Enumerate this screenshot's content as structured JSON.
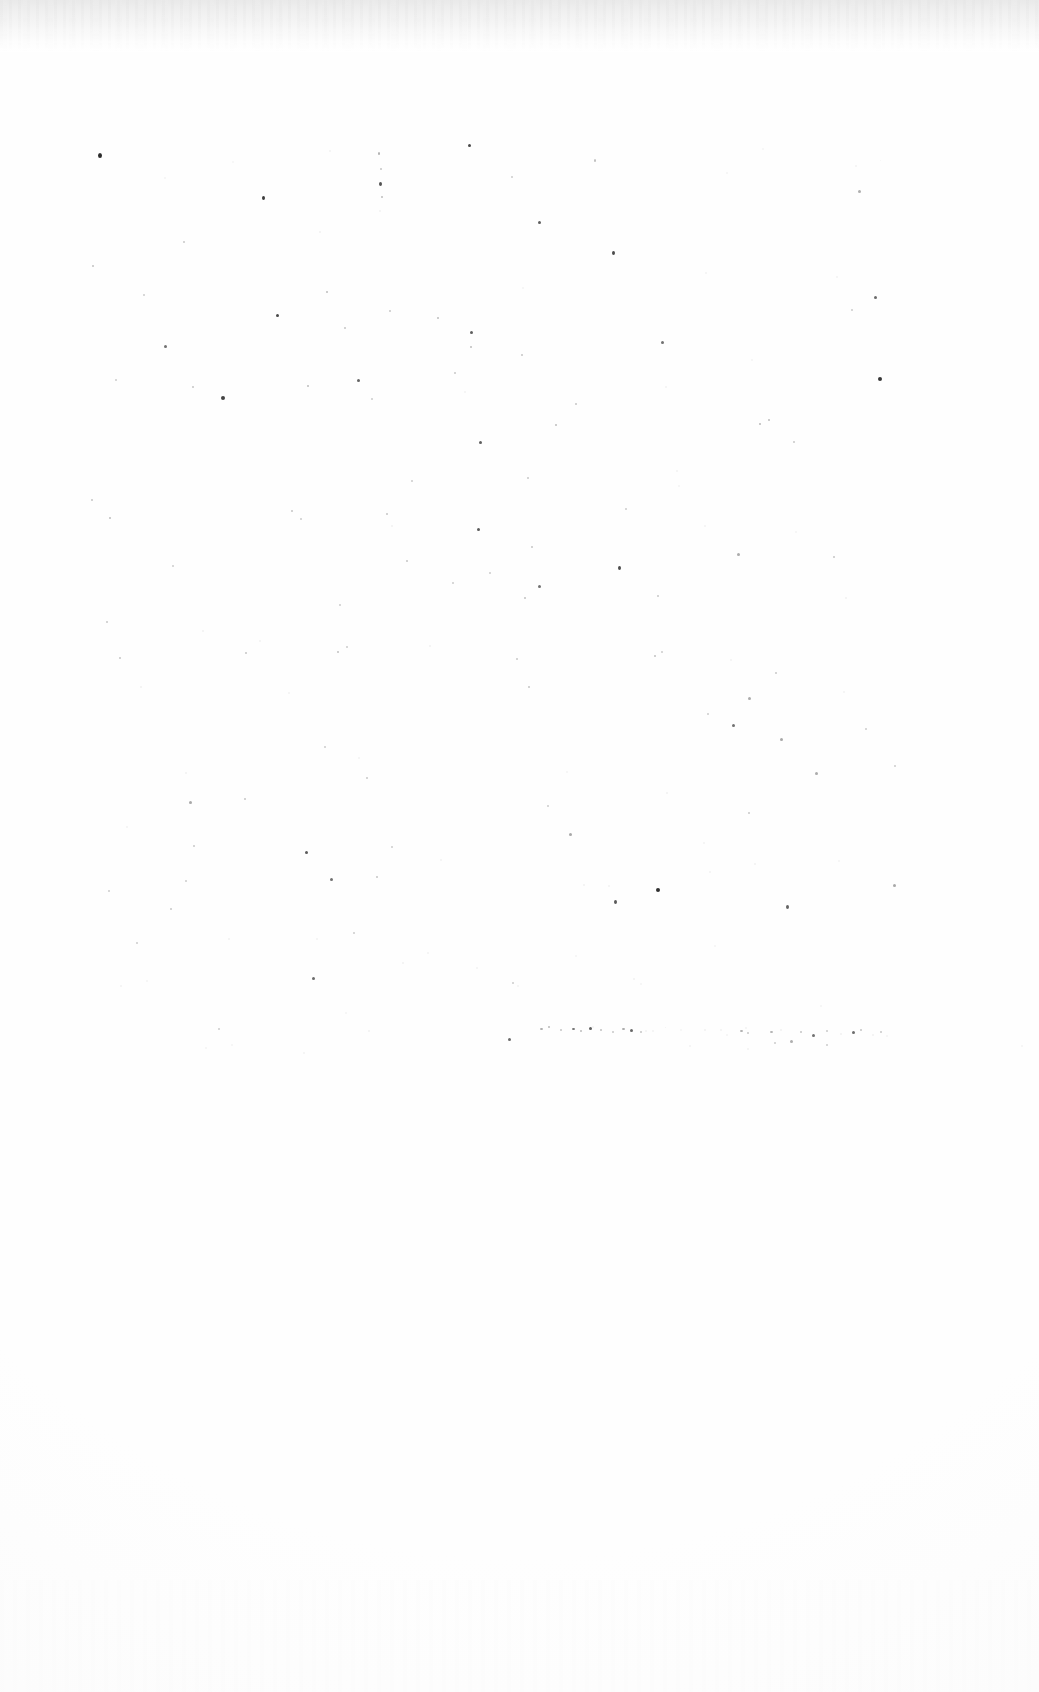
{
  "document": {
    "kind": "scanned-page",
    "page_state": "blank",
    "visible_text": "",
    "width": 1039,
    "height": 1692
  },
  "appearance": {
    "page_background": "#fefefe",
    "paper_white": "#ffffff",
    "edge_shadow_color": "#e9e9e9",
    "edge_shadow_height": 52,
    "speck_dark": "#1a1a1a",
    "speck_mid": "#6e6e6e",
    "speck_light": "#d8d8d8"
  },
  "regions": {
    "top_edge_band": {
      "y": 0,
      "height": 52,
      "description": "scanner edge shadow"
    },
    "speckled_body": {
      "y": 90,
      "height": 945,
      "description": "dust and noise specks"
    },
    "ghost_print_line": {
      "y": 1020,
      "x": 540,
      "width": 350,
      "description": "faded broken line of print residue"
    },
    "blank_lower": {
      "y": 1050,
      "height": 642,
      "description": "blank white area"
    }
  },
  "specks": [
    [
      98,
      153,
      4,
      5,
      0.92
    ],
    [
      232,
      161,
      2,
      2,
      0.22
    ],
    [
      329,
      150,
      2,
      2,
      0.3
    ],
    [
      378,
      152,
      2,
      3,
      0.55
    ],
    [
      380,
      168,
      2,
      2,
      0.4
    ],
    [
      379,
      182,
      3,
      4,
      0.75
    ],
    [
      381,
      196,
      2,
      2,
      0.45
    ],
    [
      379,
      210,
      2,
      2,
      0.3
    ],
    [
      468,
      144,
      3,
      3,
      0.8
    ],
    [
      511,
      176,
      2,
      2,
      0.35
    ],
    [
      594,
      159,
      2,
      3,
      0.45
    ],
    [
      726,
      172,
      2,
      2,
      0.25
    ],
    [
      762,
      148,
      2,
      2,
      0.22
    ],
    [
      855,
      165,
      2,
      2,
      0.3
    ],
    [
      858,
      190,
      3,
      3,
      0.55
    ],
    [
      880,
      160,
      1,
      1,
      0.18
    ],
    [
      164,
      177,
      2,
      2,
      0.28
    ],
    [
      262,
      196,
      3,
      4,
      0.85
    ],
    [
      319,
      231,
      2,
      2,
      0.32
    ],
    [
      183,
      241,
      2,
      2,
      0.38
    ],
    [
      92,
      265,
      2,
      2,
      0.42
    ],
    [
      143,
      294,
      2,
      2,
      0.35
    ],
    [
      276,
      314,
      3,
      3,
      0.8
    ],
    [
      344,
      327,
      2,
      2,
      0.4
    ],
    [
      164,
      345,
      3,
      3,
      0.62
    ],
    [
      326,
      291,
      2,
      2,
      0.45
    ],
    [
      389,
      310,
      2,
      2,
      0.38
    ],
    [
      437,
      317,
      2,
      2,
      0.45
    ],
    [
      470,
      331,
      3,
      3,
      0.7
    ],
    [
      522,
      287,
      2,
      2,
      0.28
    ],
    [
      538,
      221,
      3,
      3,
      0.7
    ],
    [
      612,
      251,
      3,
      4,
      0.78
    ],
    [
      705,
      272,
      2,
      2,
      0.3
    ],
    [
      836,
      276,
      2,
      2,
      0.3
    ],
    [
      874,
      296,
      3,
      3,
      0.65
    ],
    [
      851,
      309,
      2,
      2,
      0.35
    ],
    [
      661,
      341,
      3,
      3,
      0.62
    ],
    [
      470,
      346,
      2,
      2,
      0.45
    ],
    [
      521,
      354,
      2,
      2,
      0.4
    ],
    [
      751,
      359,
      2,
      2,
      0.28
    ],
    [
      115,
      379,
      2,
      2,
      0.35
    ],
    [
      192,
      386,
      2,
      2,
      0.4
    ],
    [
      221,
      396,
      4,
      4,
      0.82
    ],
    [
      307,
      385,
      2,
      2,
      0.45
    ],
    [
      357,
      379,
      3,
      3,
      0.68
    ],
    [
      371,
      398,
      2,
      2,
      0.35
    ],
    [
      454,
      372,
      2,
      2,
      0.38
    ],
    [
      464,
      391,
      2,
      2,
      0.3
    ],
    [
      575,
      403,
      2,
      2,
      0.4
    ],
    [
      665,
      386,
      2,
      2,
      0.3
    ],
    [
      878,
      377,
      4,
      4,
      0.88
    ],
    [
      759,
      423,
      2,
      2,
      0.48
    ],
    [
      768,
      419,
      2,
      2,
      0.45
    ],
    [
      793,
      441,
      2,
      2,
      0.38
    ],
    [
      555,
      424,
      2,
      2,
      0.45
    ],
    [
      479,
      441,
      3,
      3,
      0.7
    ],
    [
      411,
      480,
      2,
      2,
      0.35
    ],
    [
      527,
      477,
      2,
      2,
      0.38
    ],
    [
      676,
      470,
      2,
      2,
      0.3
    ],
    [
      678,
      485,
      2,
      2,
      0.28
    ],
    [
      91,
      499,
      2,
      2,
      0.4
    ],
    [
      109,
      517,
      2,
      2,
      0.45
    ],
    [
      291,
      510,
      2,
      2,
      0.4
    ],
    [
      300,
      518,
      2,
      2,
      0.35
    ],
    [
      386,
      513,
      2,
      2,
      0.4
    ],
    [
      391,
      525,
      2,
      2,
      0.32
    ],
    [
      477,
      528,
      3,
      3,
      0.72
    ],
    [
      531,
      546,
      2,
      2,
      0.4
    ],
    [
      625,
      508,
      2,
      2,
      0.35
    ],
    [
      704,
      525,
      2,
      2,
      0.3
    ],
    [
      795,
      531,
      2,
      2,
      0.28
    ],
    [
      833,
      556,
      2,
      2,
      0.4
    ],
    [
      737,
      553,
      3,
      3,
      0.58
    ],
    [
      172,
      565,
      2,
      2,
      0.35
    ],
    [
      406,
      560,
      2,
      2,
      0.4
    ],
    [
      452,
      582,
      2,
      2,
      0.35
    ],
    [
      489,
      572,
      2,
      2,
      0.35
    ],
    [
      524,
      597,
      2,
      2,
      0.42
    ],
    [
      538,
      585,
      3,
      3,
      0.62
    ],
    [
      618,
      566,
      3,
      4,
      0.78
    ],
    [
      657,
      595,
      2,
      2,
      0.38
    ],
    [
      339,
      604,
      2,
      2,
      0.35
    ],
    [
      845,
      597,
      2,
      2,
      0.32
    ],
    [
      106,
      621,
      2,
      2,
      0.38
    ],
    [
      202,
      630,
      2,
      2,
      0.32
    ],
    [
      245,
      652,
      2,
      2,
      0.4
    ],
    [
      259,
      640,
      2,
      2,
      0.3
    ],
    [
      119,
      657,
      2,
      2,
      0.4
    ],
    [
      337,
      651,
      2,
      2,
      0.42
    ],
    [
      346,
      646,
      2,
      2,
      0.35
    ],
    [
      429,
      645,
      2,
      2,
      0.32
    ],
    [
      516,
      658,
      2,
      2,
      0.38
    ],
    [
      654,
      655,
      2,
      2,
      0.42
    ],
    [
      661,
      651,
      2,
      2,
      0.35
    ],
    [
      730,
      659,
      2,
      2,
      0.3
    ],
    [
      775,
      672,
      2,
      2,
      0.38
    ],
    [
      140,
      686,
      2,
      2,
      0.32
    ],
    [
      288,
      692,
      2,
      2,
      0.3
    ],
    [
      528,
      686,
      2,
      2,
      0.4
    ],
    [
      748,
      697,
      3,
      3,
      0.58
    ],
    [
      843,
      691,
      2,
      2,
      0.3
    ],
    [
      707,
      713,
      2,
      2,
      0.35
    ],
    [
      732,
      724,
      3,
      3,
      0.62
    ],
    [
      780,
      738,
      3,
      3,
      0.6
    ],
    [
      865,
      728,
      2,
      2,
      0.35
    ],
    [
      324,
      746,
      2,
      2,
      0.35
    ],
    [
      358,
      757,
      2,
      2,
      0.3
    ],
    [
      185,
      772,
      2,
      2,
      0.32
    ],
    [
      366,
      777,
      2,
      2,
      0.38
    ],
    [
      566,
      771,
      2,
      2,
      0.28
    ],
    [
      815,
      772,
      3,
      3,
      0.58
    ],
    [
      894,
      765,
      2,
      2,
      0.35
    ],
    [
      189,
      801,
      3,
      3,
      0.6
    ],
    [
      244,
      798,
      2,
      2,
      0.4
    ],
    [
      547,
      805,
      2,
      2,
      0.35
    ],
    [
      666,
      792,
      2,
      2,
      0.32
    ],
    [
      748,
      812,
      2,
      2,
      0.38
    ],
    [
      126,
      826,
      2,
      2,
      0.3
    ],
    [
      193,
      845,
      2,
      2,
      0.38
    ],
    [
      305,
      851,
      3,
      3,
      0.72
    ],
    [
      391,
      846,
      2,
      2,
      0.35
    ],
    [
      440,
      859,
      2,
      2,
      0.3
    ],
    [
      569,
      833,
      3,
      3,
      0.6
    ],
    [
      614,
      900,
      3,
      4,
      0.72
    ],
    [
      703,
      842,
      2,
      2,
      0.3
    ],
    [
      330,
      878,
      3,
      3,
      0.62
    ],
    [
      376,
      876,
      2,
      2,
      0.4
    ],
    [
      185,
      880,
      2,
      2,
      0.35
    ],
    [
      108,
      890,
      2,
      2,
      0.35
    ],
    [
      583,
      884,
      2,
      2,
      0.32
    ],
    [
      608,
      885,
      2,
      2,
      0.3
    ],
    [
      656,
      888,
      4,
      4,
      0.9
    ],
    [
      709,
      871,
      2,
      2,
      0.3
    ],
    [
      754,
      863,
      2,
      2,
      0.32
    ],
    [
      838,
      860,
      2,
      2,
      0.28
    ],
    [
      893,
      884,
      3,
      3,
      0.6
    ],
    [
      786,
      905,
      3,
      4,
      0.68
    ],
    [
      170,
      908,
      2,
      2,
      0.38
    ],
    [
      136,
      942,
      2,
      2,
      0.35
    ],
    [
      228,
      938,
      2,
      2,
      0.32
    ],
    [
      316,
      938,
      2,
      2,
      0.3
    ],
    [
      353,
      932,
      2,
      2,
      0.35
    ],
    [
      402,
      962,
      2,
      2,
      0.32
    ],
    [
      427,
      952,
      2,
      2,
      0.3
    ],
    [
      312,
      977,
      3,
      3,
      0.65
    ],
    [
      476,
      967,
      2,
      2,
      0.3
    ],
    [
      512,
      982,
      2,
      2,
      0.35
    ],
    [
      517,
      985,
      2,
      2,
      0.3
    ],
    [
      120,
      985,
      2,
      2,
      0.3
    ],
    [
      146,
      980,
      2,
      2,
      0.28
    ],
    [
      575,
      955,
      2,
      2,
      0.28
    ],
    [
      633,
      978,
      2,
      2,
      0.32
    ],
    [
      640,
      983,
      2,
      2,
      0.28
    ],
    [
      714,
      945,
      2,
      2,
      0.25
    ],
    [
      820,
      1005,
      2,
      2,
      0.28
    ],
    [
      345,
      1012,
      2,
      2,
      0.25
    ],
    [
      218,
      1028,
      2,
      2,
      0.35
    ],
    [
      368,
      1030,
      2,
      2,
      0.32
    ],
    [
      508,
      1038,
      3,
      3,
      0.65
    ],
    [
      303,
      1052,
      2,
      2,
      0.3
    ],
    [
      592,
      1026,
      2,
      2,
      0.28
    ],
    [
      645,
      1030,
      2,
      2,
      0.3
    ],
    [
      704,
      1029,
      2,
      2,
      0.32
    ],
    [
      745,
      1027,
      2,
      2,
      0.3
    ],
    [
      205,
      1047,
      2,
      2,
      0.28
    ],
    [
      231,
      1044,
      2,
      2,
      0.25
    ],
    [
      689,
      1045,
      2,
      2,
      0.3
    ],
    [
      747,
      1048,
      2,
      2,
      0.3
    ],
    [
      774,
      1042,
      2,
      2,
      0.35
    ],
    [
      790,
      1040,
      3,
      3,
      0.55
    ],
    [
      826,
      1044,
      2,
      2,
      0.35
    ],
    [
      1021,
      1045,
      2,
      2,
      0.28
    ],
    [
      1082,
      1030,
      2,
      2,
      0.25
    ]
  ],
  "ghost_marks": [
    [
      540,
      1028,
      3,
      2,
      0.58
    ],
    [
      548,
      1026,
      2,
      2,
      0.48
    ],
    [
      560,
      1029,
      2,
      2,
      0.4
    ],
    [
      572,
      1028,
      3,
      2,
      0.62
    ],
    [
      580,
      1030,
      2,
      2,
      0.45
    ],
    [
      589,
      1027,
      3,
      3,
      0.7
    ],
    [
      600,
      1029,
      2,
      2,
      0.42
    ],
    [
      612,
      1031,
      2,
      2,
      0.38
    ],
    [
      622,
      1028,
      3,
      2,
      0.6
    ],
    [
      630,
      1029,
      3,
      3,
      0.66
    ],
    [
      640,
      1031,
      2,
      2,
      0.4
    ],
    [
      652,
      1030,
      2,
      2,
      0.3
    ],
    [
      665,
      1027,
      1,
      1,
      0.22
    ],
    [
      680,
      1029,
      2,
      2,
      0.26
    ],
    [
      720,
      1029,
      2,
      2,
      0.3
    ],
    [
      726,
      1034,
      2,
      2,
      0.28
    ],
    [
      740,
      1030,
      3,
      2,
      0.55
    ],
    [
      747,
      1032,
      2,
      2,
      0.38
    ],
    [
      770,
      1031,
      3,
      2,
      0.52
    ],
    [
      780,
      1029,
      2,
      2,
      0.34
    ],
    [
      800,
      1031,
      2,
      2,
      0.4
    ],
    [
      812,
      1034,
      3,
      3,
      0.62
    ],
    [
      826,
      1030,
      2,
      2,
      0.36
    ],
    [
      840,
      1033,
      2,
      2,
      0.32
    ],
    [
      852,
      1031,
      3,
      3,
      0.64
    ],
    [
      860,
      1029,
      2,
      2,
      0.4
    ],
    [
      872,
      1034,
      2,
      2,
      0.34
    ],
    [
      880,
      1031,
      2,
      2,
      0.38
    ],
    [
      886,
      1035,
      2,
      2,
      0.28
    ]
  ]
}
